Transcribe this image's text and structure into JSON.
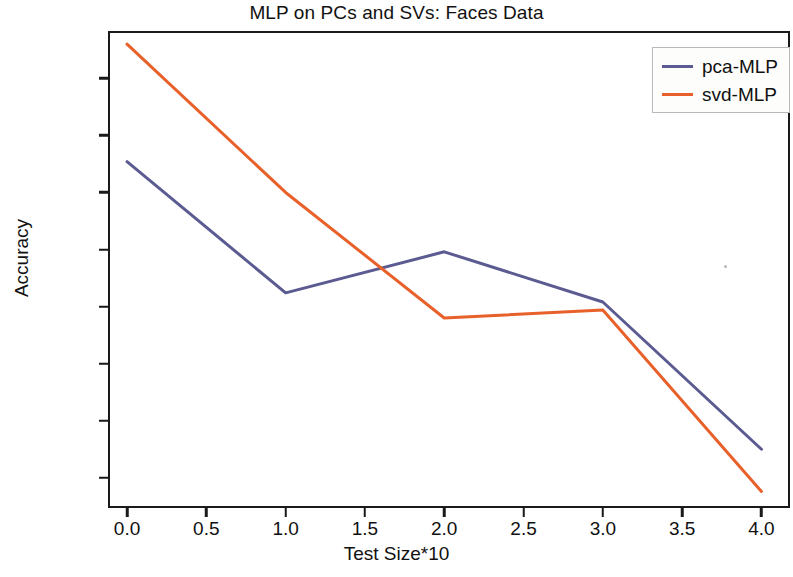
{
  "chart_data": {
    "type": "line",
    "title": "MLP on PCs and SVs: Faces Data",
    "xlabel": "Test Size*10",
    "ylabel": "Accuracy",
    "x": [
      0.0,
      1.0,
      2.0,
      3.0,
      4.0
    ],
    "series": [
      {
        "name": "pca-MLP",
        "color": "#5b5b92",
        "values": [
          0.727,
          0.612,
          0.648,
          0.604,
          0.475
        ]
      },
      {
        "name": "svd-MLP",
        "color": "#e8602a",
        "values": [
          0.83,
          0.7,
          0.59,
          0.597,
          0.438
        ]
      }
    ],
    "xlim": [
      -0.12,
      4.18
    ],
    "ylim": [
      0.4235,
      0.8415
    ],
    "xticks": [
      0.0,
      0.5,
      1.0,
      1.5,
      2.0,
      2.5,
      3.0,
      3.5,
      4.0
    ],
    "xtick_labels": [
      "0.0",
      "0.5",
      "1.0",
      "1.5",
      "2.0",
      "2.5",
      "3.0",
      "3.5",
      "4.0"
    ],
    "yticks": [
      0.45,
      0.5,
      0.55,
      0.6,
      0.65,
      0.7,
      0.75,
      0.8
    ],
    "ytick_labels": [
      "0.45",
      "0.50",
      "0.55",
      "0.60",
      "0.65",
      "0.70",
      "0.75",
      "0.80"
    ],
    "grid": false,
    "legend_position": "upper right",
    "legend_entries": [
      "pca-MLP",
      "svd-MLP"
    ]
  }
}
